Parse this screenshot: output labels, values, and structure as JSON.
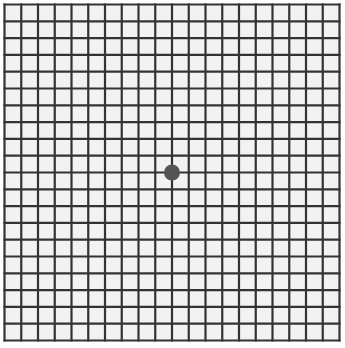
{
  "grid": {
    "rows": 20,
    "cols": 20,
    "line_color": "#333333",
    "cell_color": "#f2f2f2"
  },
  "fixation_dot": {
    "color": "#555555"
  }
}
